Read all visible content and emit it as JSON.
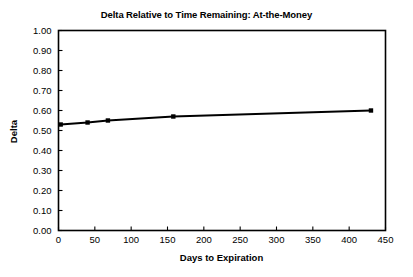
{
  "chart_data": {
    "type": "line",
    "title": "Delta Relative to Time Remaining: At-the-Money",
    "xlabel": "Days to Expiration",
    "ylabel": "Delta",
    "grid": false,
    "legend": "none",
    "xlim": [
      0,
      450
    ],
    "ylim": [
      0.0,
      1.0
    ],
    "xticks": [
      0,
      50,
      100,
      150,
      200,
      250,
      300,
      350,
      400,
      450
    ],
    "xtick_labels": [
      "0",
      "50",
      "100",
      "150",
      "200",
      "250",
      "300",
      "350",
      "400",
      "450"
    ],
    "yticks": [
      0.0,
      0.1,
      0.2,
      0.3,
      0.4,
      0.5,
      0.6,
      0.7,
      0.8,
      0.9,
      1.0
    ],
    "ytick_labels": [
      "0.00",
      "0.10",
      "0.20",
      "0.30",
      "0.40",
      "0.50",
      "0.60",
      "0.70",
      "0.80",
      "0.90",
      "1.00"
    ],
    "series": [
      {
        "name": "At-the-Money Delta",
        "color": "#000000",
        "marker": "square",
        "x": [
          3,
          40,
          68,
          158,
          430
        ],
        "values": [
          0.53,
          0.54,
          0.55,
          0.57,
          0.6
        ]
      }
    ]
  }
}
